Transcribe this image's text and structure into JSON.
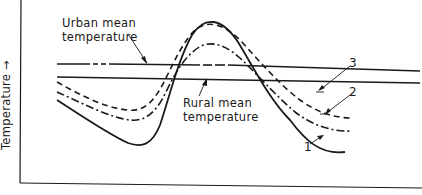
{
  "diagram": {
    "type": "schematic temperature curves",
    "y_axis_label": "Temperature →",
    "x_axis_label": "",
    "annotations": {
      "urban_label_line1": "Urban mean",
      "urban_label_line2": "temperature",
      "rural_label_line1": "Rural mean",
      "rural_label_line2": "temperature"
    },
    "curves": [
      {
        "id": "1",
        "label": "1",
        "style": "solid"
      },
      {
        "id": "2",
        "label": "2",
        "style": "dash-dot"
      },
      {
        "id": "3",
        "label": "3",
        "style": "dashed"
      }
    ],
    "reference_lines": [
      {
        "name": "Urban mean temperature",
        "style": "solid with dash-dot segment"
      },
      {
        "name": "Rural mean temperature",
        "style": "solid"
      }
    ],
    "colors": {
      "ink": "#1a1a1a",
      "background": "#ffffff"
    }
  }
}
